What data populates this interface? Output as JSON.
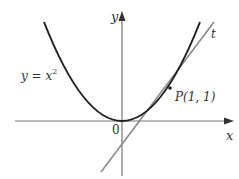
{
  "diagram": {
    "type": "function-graph-with-tangent",
    "axes": {
      "x_label": "x",
      "y_label": "y",
      "origin_label": "0"
    },
    "curve": {
      "label_lhs": "y = x",
      "label_exp": "2",
      "equation": "y = x^2"
    },
    "point": {
      "label": "P(1, 1)",
      "x": 1,
      "y": 1
    },
    "tangent": {
      "label": "t",
      "equation": "y = 2x - 1"
    },
    "colors": {
      "curve": "#222222",
      "tangent": "#8a8a8a",
      "axes": "#666666",
      "text": "#333333"
    }
  }
}
